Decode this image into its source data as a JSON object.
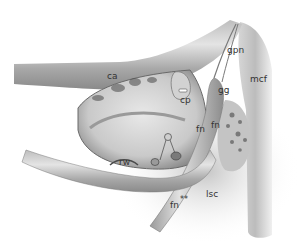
{
  "figure": {
    "labels": [
      {
        "id": "ca",
        "text": "ca",
        "x": 107,
        "y": 72
      },
      {
        "id": "gpn",
        "text": "gpn",
        "x": 227,
        "y": 46
      },
      {
        "id": "mcf",
        "text": "mcf",
        "x": 250,
        "y": 75
      },
      {
        "id": "cp",
        "text": "cp",
        "x": 180,
        "y": 96
      },
      {
        "id": "gg",
        "text": "gg",
        "x": 218,
        "y": 86
      },
      {
        "id": "fn-upper-left",
        "text": "fn",
        "x": 196,
        "y": 125
      },
      {
        "id": "fn-upper-right",
        "text": "fn",
        "x": 211,
        "y": 121
      },
      {
        "id": "rw",
        "text": "rw",
        "x": 119,
        "y": 158
      },
      {
        "id": "lsc",
        "text": "lsc",
        "x": 206,
        "y": 190
      },
      {
        "id": "fn-lower",
        "text": "fn",
        "x": 170,
        "y": 201
      },
      {
        "id": "asterisks",
        "text": "**",
        "x": 180,
        "y": 196
      }
    ]
  }
}
